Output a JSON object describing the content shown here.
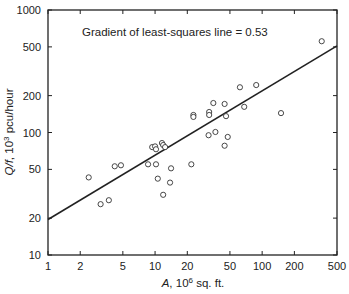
{
  "chart_data": {
    "type": "scatter",
    "title": "",
    "annotation": "Gradient of least-squares line = 0.53",
    "xlabel": "A, 10⁶ sq. ft.",
    "xlabel_italic": "A",
    "xlabel_rest": ", 10",
    "xlabel_sup": "6",
    "xlabel_tail": " sq. ft.",
    "ylabel_italic": "Q/f",
    "ylabel_rest": ", 10",
    "ylabel_sup": "3",
    "ylabel_tail": " pcu/hour",
    "ylabel": "Q/f, 10³ pcu/hour",
    "xscale": "log",
    "yscale": "log",
    "xlim": [
      1,
      500
    ],
    "ylim": [
      10,
      1000
    ],
    "xticks": [
      1,
      2,
      5,
      10,
      20,
      50,
      100,
      200,
      500
    ],
    "yticks": [
      10,
      20,
      50,
      100,
      200,
      500,
      1000
    ],
    "grid": false,
    "legend": null,
    "series": [
      {
        "name": "observations",
        "marker": "open-circle",
        "points": [
          [
            2.4,
            43
          ],
          [
            3.1,
            26
          ],
          [
            3.7,
            28
          ],
          [
            4.2,
            53
          ],
          [
            4.8,
            54
          ],
          [
            8.6,
            55
          ],
          [
            9.4,
            76
          ],
          [
            10.0,
            77
          ],
          [
            10.2,
            73
          ],
          [
            11.6,
            82
          ],
          [
            11.9,
            79
          ],
          [
            12.4,
            76
          ],
          [
            10.2,
            55
          ],
          [
            14.1,
            51
          ],
          [
            10.6,
            42
          ],
          [
            13.8,
            39
          ],
          [
            11.9,
            31
          ],
          [
            21.8,
            55
          ],
          [
            22.8,
            139
          ],
          [
            22.8,
            134
          ],
          [
            32,
            147
          ],
          [
            32,
            139
          ],
          [
            35,
            174
          ],
          [
            44.6,
            171
          ],
          [
            46,
            136
          ],
          [
            31.6,
            95
          ],
          [
            36.6,
            101
          ],
          [
            47.7,
            92
          ],
          [
            44.6,
            78
          ],
          [
            62,
            234
          ],
          [
            68,
            162
          ],
          [
            88,
            244
          ],
          [
            150,
            144
          ],
          [
            360,
            556
          ]
        ]
      },
      {
        "name": "least-squares line",
        "type": "line",
        "gradient": 0.53,
        "points": [
          [
            1,
            19.5
          ],
          [
            500,
            510
          ]
        ]
      }
    ]
  }
}
